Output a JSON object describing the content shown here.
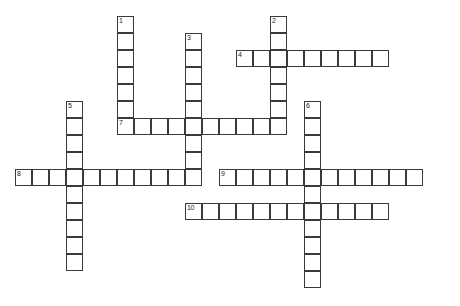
{
  "puzzle": {
    "type": "crossword-grid",
    "title": "",
    "cell_size": 17,
    "grid_origin": {
      "x": 15,
      "y": 16
    },
    "colors": {
      "cell_border": "#3a3a3a",
      "cell_fill": "#ffffff",
      "background": "#ffffff",
      "number_text": "#1a1a1a"
    },
    "entries": [
      {
        "number": "1",
        "direction": "down",
        "col": 6,
        "row": 0,
        "length": 7
      },
      {
        "number": "2",
        "direction": "down",
        "col": 15,
        "row": 0,
        "length": 7
      },
      {
        "number": "3",
        "direction": "down",
        "col": 10,
        "row": 1,
        "length": 9
      },
      {
        "number": "4",
        "direction": "across",
        "col": 13,
        "row": 2,
        "length": 9
      },
      {
        "number": "5",
        "direction": "down",
        "col": 3,
        "row": 5,
        "length": 10
      },
      {
        "number": "6",
        "direction": "down",
        "col": 17,
        "row": 5,
        "length": 11
      },
      {
        "number": "7",
        "direction": "across",
        "col": 6,
        "row": 6,
        "length": 10
      },
      {
        "number": "8",
        "direction": "across",
        "col": 0,
        "row": 9,
        "length": 10
      },
      {
        "number": "9",
        "direction": "across",
        "col": 12,
        "row": 9,
        "length": 12
      },
      {
        "number": "10",
        "direction": "across",
        "col": 10,
        "row": 11,
        "length": 12
      }
    ]
  }
}
